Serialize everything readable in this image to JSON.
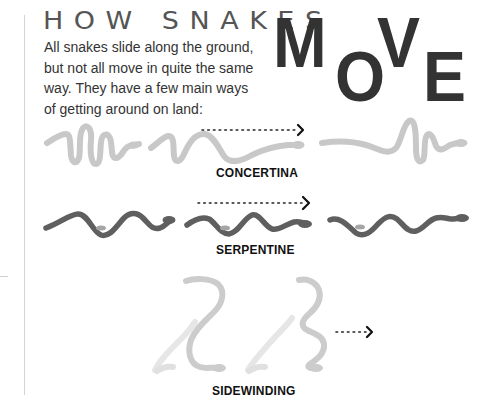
{
  "header": {
    "title_thin": "HOW SNAKES",
    "title_big": [
      "M",
      "O",
      "V",
      "E"
    ]
  },
  "intro": {
    "lines": [
      "All snakes slide along the ground,",
      "but not all move in quite the same",
      "way. They have a few main ways",
      "of getting around on land:"
    ]
  },
  "sections": [
    {
      "label": "CONCERTINA",
      "snake_color": "#c8c8c8",
      "arrow": "dotted-right-arrow"
    },
    {
      "label": "SERPENTINE",
      "snake_color": "#5f5f5f",
      "arrow": "dotted-right-arrow"
    },
    {
      "label": "SIDEWINDING",
      "snake_color": "#cccccc",
      "arrow": "dotted-right-arrow"
    }
  ],
  "colors": {
    "title_thin": "#555555",
    "title_big": "#333333",
    "body_text": "#333333",
    "label_text": "#111111",
    "rule": "#d4d4d4"
  }
}
